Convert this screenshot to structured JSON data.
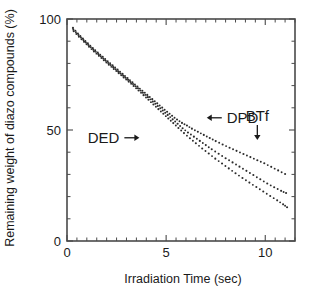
{
  "chart_data": {
    "type": "scatter",
    "title": "",
    "xlabel": "Irradiation Time (sec)",
    "ylabel": "Remaining weight of diazo compounds (%)",
    "xlim": [
      0,
      11.5
    ],
    "ylim": [
      0,
      100
    ],
    "grid": false,
    "legend_position": "inline-annotations",
    "x_ticks_major": [
      0,
      5,
      10
    ],
    "x_tick_labels": [
      "0",
      "5",
      "10"
    ],
    "x_tick_minor_step": 0.5,
    "y_ticks_major": [
      0,
      50,
      100
    ],
    "y_tick_labels": [
      "0",
      "50",
      "100"
    ],
    "y_tick_minor_step": 10,
    "frame": "box",
    "tick_direction": "in",
    "marker": "small-dot",
    "series": [
      {
        "name": "DPD",
        "label": "DPD",
        "x": [
          0.3,
          0.55,
          0.8,
          1.05,
          1.3,
          1.55,
          1.8,
          2.05,
          2.3,
          2.55,
          2.8,
          3.05,
          3.3,
          3.55,
          3.8,
          4.05,
          4.3,
          4.55,
          4.8,
          5.05,
          5.3,
          5.55,
          5.8,
          6.05,
          6.3,
          6.6,
          6.9,
          7.2,
          7.5,
          7.85,
          8.2,
          8.55,
          8.9,
          9.25,
          9.6,
          9.95,
          10.3,
          10.65,
          11.0
        ],
        "y": [
          96.0,
          93.5,
          91.2,
          89.0,
          86.9,
          84.9,
          83.0,
          81.0,
          79.1,
          77.2,
          75.3,
          73.4,
          71.5,
          69.6,
          67.7,
          65.8,
          63.9,
          62.0,
          60.1,
          58.2,
          56.4,
          54.7,
          53.2,
          52.0,
          50.6,
          49.2,
          47.8,
          46.4,
          45.0,
          43.5,
          42.0,
          40.6,
          39.2,
          37.8,
          36.4,
          35.0,
          33.4,
          31.8,
          30.2
        ]
      },
      {
        "name": "DED",
        "label": "DED",
        "x": [
          0.32,
          0.58,
          0.83,
          1.08,
          1.33,
          1.58,
          1.83,
          2.08,
          2.33,
          2.58,
          2.83,
          3.08,
          3.33,
          3.58,
          3.83,
          4.08,
          4.33,
          4.58,
          4.83,
          5.08,
          5.33,
          5.58,
          5.83,
          6.1,
          6.4,
          6.7,
          7.0,
          7.3,
          7.65,
          8.0,
          8.35,
          8.7,
          9.05,
          9.4,
          9.75,
          10.1,
          10.45,
          10.8,
          11.05
        ],
        "y": [
          95.2,
          92.8,
          90.5,
          88.3,
          86.2,
          84.2,
          82.2,
          80.2,
          78.3,
          76.4,
          74.5,
          72.6,
          70.7,
          68.8,
          66.8,
          64.8,
          62.8,
          60.8,
          58.8,
          56.8,
          54.8,
          52.8,
          50.8,
          48.9,
          47.0,
          45.1,
          43.2,
          41.3,
          39.3,
          37.3,
          35.4,
          33.5,
          31.6,
          29.7,
          27.8,
          25.9,
          24.2,
          22.6,
          21.6
        ]
      },
      {
        "name": "BTf",
        "label": "BTf",
        "x": [
          0.34,
          0.6,
          0.86,
          1.11,
          1.36,
          1.61,
          1.86,
          2.11,
          2.36,
          2.61,
          2.86,
          3.11,
          3.36,
          3.61,
          3.86,
          4.11,
          4.36,
          4.61,
          4.86,
          5.11,
          5.36,
          5.62,
          5.9,
          6.2,
          6.5,
          6.82,
          7.15,
          7.48,
          7.82,
          8.16,
          8.5,
          8.85,
          9.2,
          9.55,
          9.9,
          10.25,
          10.6,
          10.9,
          11.1
        ],
        "y": [
          94.5,
          92.0,
          89.7,
          87.5,
          85.4,
          83.4,
          81.4,
          79.4,
          77.5,
          75.6,
          73.7,
          71.8,
          69.8,
          67.8,
          65.7,
          63.6,
          61.5,
          59.4,
          57.3,
          55.2,
          53.1,
          50.9,
          48.6,
          46.3,
          44.0,
          41.7,
          39.4,
          37.1,
          34.9,
          32.7,
          30.5,
          28.4,
          26.3,
          24.3,
          22.3,
          20.3,
          18.3,
          16.5,
          15.2
        ]
      }
    ],
    "annotations": [
      {
        "name": "dpd",
        "text": "DPD",
        "arrow": "left",
        "x_data": 7.05,
        "y_data": 55.5
      },
      {
        "name": "ded",
        "text": "DED",
        "arrow": "right",
        "x_data": 3.65,
        "y_data": 46.5
      },
      {
        "name": "btf",
        "text": "BTf",
        "arrow": "down",
        "x_data": 9.6,
        "y_data": 45.5
      }
    ]
  },
  "colors": {
    "axis": "#4a4a4a",
    "text": "#1a1a1a",
    "marker": "#2b2b2b",
    "background": "#ffffff"
  }
}
